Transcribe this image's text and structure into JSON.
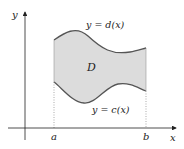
{
  "diagram": {
    "type": "region-between-curves",
    "region_label": "D",
    "top_curve_label": "y = d(x)",
    "bottom_curve_label": "y = c(x)",
    "x_axis_label": "x",
    "y_axis_label": "y",
    "left_bound_label": "a",
    "right_bound_label": "b",
    "colors": {
      "region_fill": "#dcdcdc",
      "curve_stroke": "#555555",
      "axis": "#222222",
      "dotted_line": "#888888"
    }
  }
}
